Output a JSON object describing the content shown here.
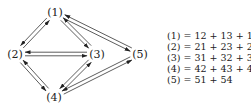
{
  "diagram": {
    "nodes": [
      {
        "id": "1",
        "label": "(1)",
        "x": 55,
        "y": 12
      },
      {
        "id": "2",
        "label": "(2)",
        "x": 15,
        "y": 54
      },
      {
        "id": "3",
        "label": "(3)",
        "x": 97,
        "y": 54
      },
      {
        "id": "4",
        "label": "(4)",
        "x": 54,
        "y": 97
      },
      {
        "id": "5",
        "label": "(5)",
        "x": 140,
        "y": 54
      }
    ],
    "edges": [
      {
        "from": "1",
        "to": "2"
      },
      {
        "from": "2",
        "to": "1"
      },
      {
        "from": "1",
        "to": "3"
      },
      {
        "from": "3",
        "to": "1"
      },
      {
        "from": "1",
        "to": "5"
      },
      {
        "from": "5",
        "to": "1"
      },
      {
        "from": "2",
        "to": "3"
      },
      {
        "from": "3",
        "to": "2"
      },
      {
        "from": "2",
        "to": "4"
      },
      {
        "from": "4",
        "to": "2"
      },
      {
        "from": "3",
        "to": "4"
      },
      {
        "from": "4",
        "to": "3"
      },
      {
        "from": "4",
        "to": "5"
      },
      {
        "from": "5",
        "to": "4"
      }
    ]
  },
  "equations": [
    {
      "lhs": "(1)",
      "rhs": "= 12 + 13 + 15"
    },
    {
      "lhs": "(2)",
      "rhs": "= 21 + 23 + 24"
    },
    {
      "lhs": "(3)",
      "rhs": "= 31 + 32 + 34"
    },
    {
      "lhs": "(4)",
      "rhs": "= 42 + 43 + 45"
    },
    {
      "lhs": "(5)",
      "rhs": "= 51 + 54"
    }
  ]
}
